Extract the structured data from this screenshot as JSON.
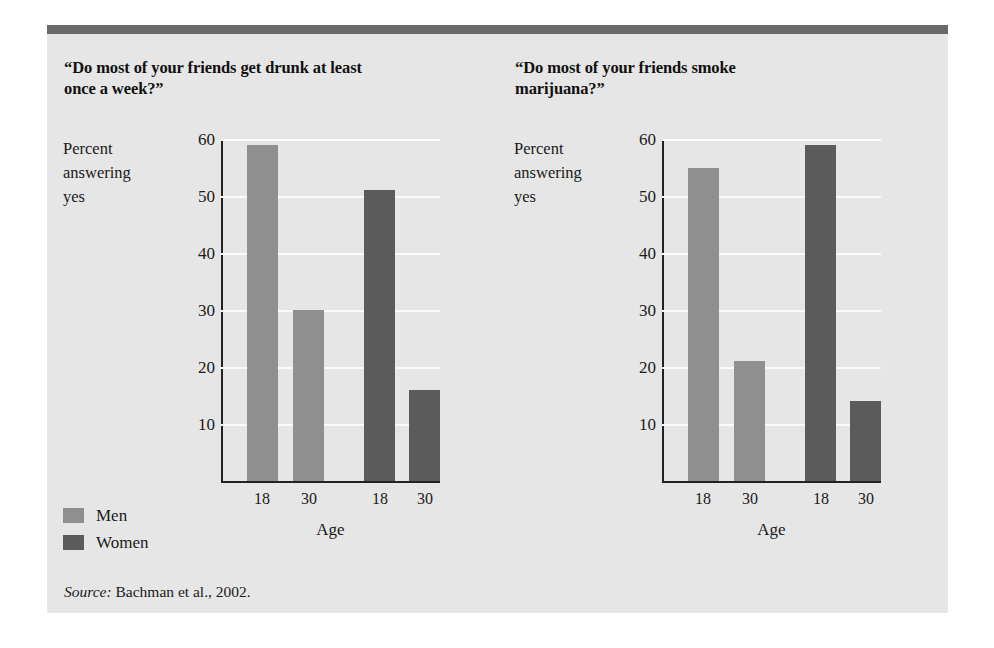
{
  "figure": {
    "source_keyword": "Source:",
    "source_text": " Bachman et al., 2002.",
    "legend": [
      {
        "label": "Men",
        "color": "#8f8f8f"
      },
      {
        "label": "Women",
        "color": "#5b5b5b"
      }
    ],
    "colors": {
      "background": "#e6e6e6",
      "top_rule": "#696969",
      "gridline": "#fbfbfb",
      "axis": "#222222",
      "men": "#8f8f8f",
      "women": "#5b5b5b"
    }
  },
  "chart_data": [
    {
      "type": "bar",
      "title": "“Do most of your friends get drunk at least once a week?”",
      "ylabel": "Percent\nanswering\nyes",
      "xlabel": "Age",
      "ylim": [
        0,
        60
      ],
      "yticks": [
        60,
        50,
        40,
        30,
        20,
        10
      ],
      "ytick_labels": [
        "60",
        "50",
        "40",
        "30",
        "20",
        "10"
      ],
      "grid": true,
      "legend_position": "below-left",
      "categories": [
        "18",
        "30",
        "18",
        "30"
      ],
      "series": [
        {
          "name": "Men",
          "categories": [
            "18",
            "30"
          ],
          "values": [
            59,
            30
          ]
        },
        {
          "name": "Women",
          "categories": [
            "18",
            "30"
          ],
          "values": [
            51,
            16
          ]
        }
      ],
      "bars": [
        {
          "group": "Men",
          "x": "18",
          "value": 59
        },
        {
          "group": "Men",
          "x": "30",
          "value": 30
        },
        {
          "group": "Women",
          "x": "18",
          "value": 51
        },
        {
          "group": "Women",
          "x": "30",
          "value": 16
        }
      ]
    },
    {
      "type": "bar",
      "title": "“Do most of your friends smoke marijuana?”",
      "ylabel": "Percent\nanswering\nyes",
      "xlabel": "Age",
      "ylim": [
        0,
        60
      ],
      "yticks": [
        60,
        50,
        40,
        30,
        20,
        10
      ],
      "ytick_labels": [
        "60",
        "50",
        "40",
        "30",
        "20",
        "10"
      ],
      "grid": true,
      "legend_position": "shared",
      "categories": [
        "18",
        "30",
        "18",
        "30"
      ],
      "series": [
        {
          "name": "Men",
          "categories": [
            "18",
            "30"
          ],
          "values": [
            55,
            21
          ]
        },
        {
          "name": "Women",
          "categories": [
            "18",
            "30"
          ],
          "values": [
            59,
            14
          ]
        }
      ],
      "bars": [
        {
          "group": "Men",
          "x": "18",
          "value": 55
        },
        {
          "group": "Men",
          "x": "30",
          "value": 21
        },
        {
          "group": "Women",
          "x": "18",
          "value": 59
        },
        {
          "group": "Women",
          "x": "30",
          "value": 14
        }
      ]
    }
  ]
}
